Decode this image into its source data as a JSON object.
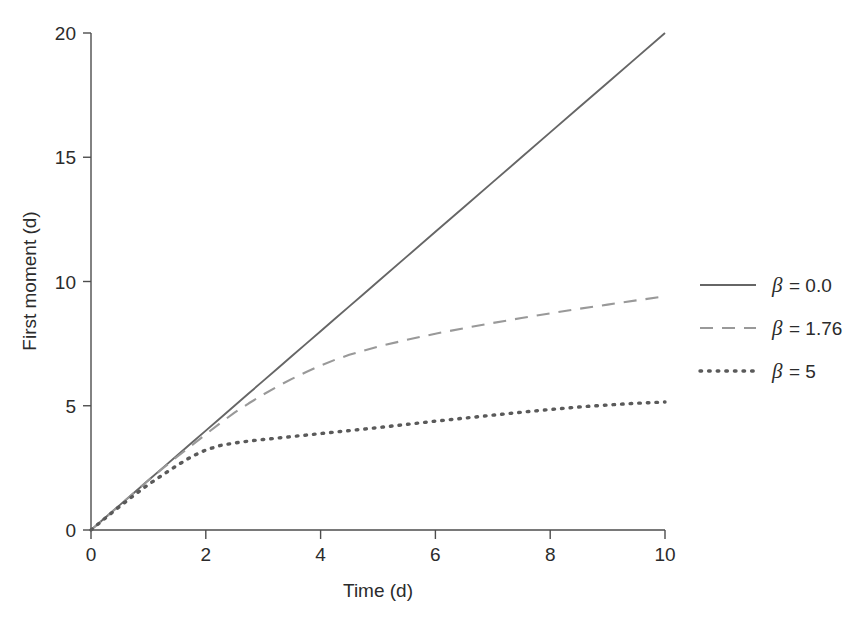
{
  "chart_data": {
    "type": "line",
    "title": "",
    "xlabel": "Time (d)",
    "ylabel": "First moment (d)",
    "xlim": [
      0,
      10
    ],
    "ylim": [
      0,
      20
    ],
    "xticks": [
      0,
      2,
      4,
      6,
      8,
      10
    ],
    "yticks": [
      0,
      5,
      10,
      15,
      20
    ],
    "xtick_labels": [
      "0",
      "2",
      "4",
      "6",
      "8",
      "10"
    ],
    "ytick_labels": [
      "0",
      "5",
      "10",
      "15",
      "20"
    ],
    "grid": false,
    "legend_position": "right-outside",
    "x": [
      0,
      0.25,
      0.5,
      0.75,
      1,
      1.25,
      1.5,
      1.75,
      2,
      2.25,
      2.5,
      2.75,
      3,
      3.25,
      3.5,
      3.75,
      4,
      4.25,
      4.5,
      4.75,
      5,
      5.5,
      6,
      6.5,
      7,
      7.5,
      8,
      8.5,
      9,
      9.5,
      10
    ],
    "series": [
      {
        "name": "beta = 0.0",
        "legend_label": "β = 0.0",
        "beta": "0.0",
        "style": "solid",
        "color": "#666666",
        "values": [
          0,
          0.5,
          1.0,
          1.5,
          2.0,
          2.5,
          3.0,
          3.5,
          4.0,
          4.5,
          5.0,
          5.5,
          6.0,
          6.5,
          7.0,
          7.5,
          8.0,
          8.5,
          9.0,
          9.5,
          10.0,
          11.0,
          12.0,
          13.0,
          14.0,
          15.0,
          16.0,
          17.0,
          18.0,
          19.0,
          20.0
        ]
      },
      {
        "name": "beta = 1.76",
        "legend_label": "β = 1.76",
        "beta": "1.76",
        "style": "dashed",
        "color": "#999999",
        "values": [
          0,
          0.5,
          1.0,
          1.5,
          2.0,
          2.48,
          2.95,
          3.4,
          3.85,
          4.3,
          4.72,
          5.1,
          5.45,
          5.78,
          6.08,
          6.36,
          6.62,
          6.85,
          7.05,
          7.22,
          7.38,
          7.65,
          7.9,
          8.12,
          8.33,
          8.53,
          8.72,
          8.9,
          9.07,
          9.24,
          9.4
        ]
      },
      {
        "name": "beta = 5",
        "legend_label": "β = 5",
        "beta": "5",
        "style": "dotted",
        "color": "#5a5a5a",
        "values": [
          0,
          0.48,
          0.95,
          1.4,
          1.83,
          2.22,
          2.6,
          2.95,
          3.22,
          3.4,
          3.5,
          3.58,
          3.64,
          3.7,
          3.76,
          3.82,
          3.88,
          3.94,
          4.0,
          4.06,
          4.12,
          4.25,
          4.38,
          4.5,
          4.62,
          4.74,
          4.85,
          4.95,
          5.03,
          5.1,
          5.15
        ]
      }
    ]
  },
  "axes": {
    "x_title": "Time (d)",
    "y_title": "First moment (d)"
  },
  "legend": {
    "entries": [
      {
        "label": "β = 0.0",
        "beta_symbol": "β",
        "equals_value": "= 0.0",
        "style": "solid"
      },
      {
        "label": "β = 1.76",
        "beta_symbol": "β",
        "equals_value": "= 1.76",
        "style": "dashed"
      },
      {
        "label": "β = 5",
        "beta_symbol": "β",
        "equals_value": "= 5",
        "style": "dotted"
      }
    ]
  }
}
